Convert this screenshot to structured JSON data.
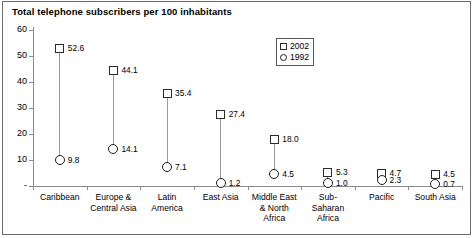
{
  "chart_data": {
    "type": "scatter",
    "title": "Total telephone subscribers per 100 inhabitants",
    "xlabel": "",
    "ylabel": "",
    "ylim": [
      0,
      60
    ],
    "yticks": [
      "-",
      "10",
      "20",
      "30",
      "40",
      "50",
      "60"
    ],
    "ytick_values": [
      0,
      10,
      20,
      30,
      40,
      50,
      60
    ],
    "grid": false,
    "legend_position": "top-right",
    "categories": [
      "Caribbean",
      "Europe &\nCentral Asia",
      "Latin\nAmerica",
      "East Asia",
      "Middle East\n& North\nAfrica",
      "Sub-\nSaharan\nAfrica",
      "Pacific",
      "South Asia"
    ],
    "series": [
      {
        "name": "2002",
        "marker": "square",
        "values": [
          52.6,
          44.1,
          35.4,
          27.4,
          18.0,
          5.3,
          4.7,
          4.5
        ],
        "labels": [
          "52.6",
          "44.1",
          "35.4",
          "27.4",
          "18.0",
          "5.3",
          "4.7",
          "4.5"
        ]
      },
      {
        "name": "1992",
        "marker": "circle",
        "values": [
          9.8,
          14.1,
          7.1,
          1.2,
          4.5,
          1.0,
          2.3,
          0.7
        ],
        "labels": [
          "9.8",
          "14.1",
          "7.1",
          "1.2",
          "4.5",
          "1.0",
          "2.3",
          "0.7"
        ]
      }
    ]
  },
  "legend": {
    "items": [
      {
        "label": "2002",
        "marker": "square"
      },
      {
        "label": "1992",
        "marker": "circle"
      }
    ]
  }
}
